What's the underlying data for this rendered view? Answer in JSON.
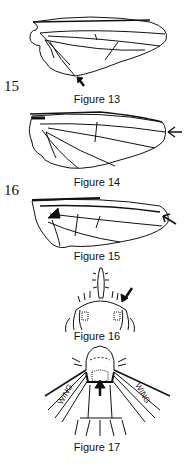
{
  "figures": [
    {
      "id": "13",
      "caption": "Figure 13",
      "subject": "fly wing with arrow at lower margin"
    },
    {
      "id": "14",
      "caption": "Figure 14",
      "subject": "fly wing with arrow at wing tip"
    },
    {
      "id": "15",
      "caption": "Figure 15",
      "subject": "fly wing with arrow at wing tip, thickened costa"
    },
    {
      "id": "16",
      "caption": "Figure 16",
      "subject": "head with antenna, arrow to bristles"
    },
    {
      "id": "17",
      "caption": "Figure 17",
      "subject": "thorax dorsal view between wings, arrow to scutellum"
    }
  ],
  "side_numbers": {
    "first": "15",
    "second": "16"
  },
  "labels": {
    "wing_left": "WING",
    "wing_right": "WING"
  },
  "colors": {
    "ink": "#111111",
    "paper": "#ffffff"
  }
}
